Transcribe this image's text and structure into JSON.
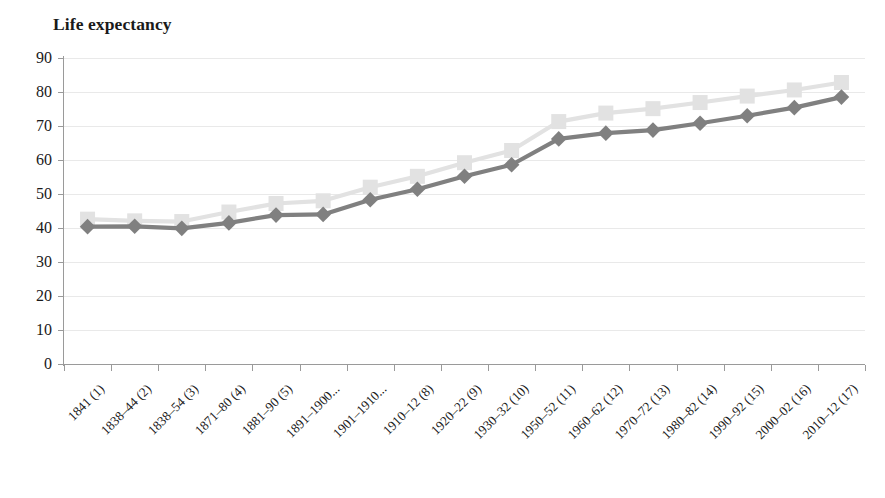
{
  "chart_data": {
    "type": "line",
    "title": "Life expectancy",
    "xlabel": "",
    "ylabel": "",
    "ylim": [
      0,
      90
    ],
    "ytick_step": 10,
    "yticks": [
      90,
      80,
      70,
      60,
      50,
      40,
      30,
      20,
      10,
      0
    ],
    "grid": true,
    "legend_position": "none",
    "categories": [
      "1841 (1)",
      "1838–44 (2)",
      "1838–54 (3)",
      "1871–80 (4)",
      "1881–90 (5)",
      "1891–1900...",
      "1901–1910...",
      "1910–12 (8)",
      "1920–22 (9)",
      "1930–32 (10)",
      "1950–52 (11)",
      "1960–62 (12)",
      "1970–72 (13)",
      "1980–82 (14)",
      "1990–92 (15)",
      "2000–02 (16)",
      "2010–12 (17)"
    ],
    "series": [
      {
        "name": "upper-series",
        "marker": "square",
        "color": "#e2e2e2",
        "values": [
          42.6,
          42.1,
          41.9,
          44.7,
          47.2,
          48.0,
          52.0,
          55.2,
          59.2,
          62.8,
          71.3,
          73.8,
          75.1,
          76.9,
          78.8,
          80.6,
          82.8
        ]
      },
      {
        "name": "lower-series",
        "marker": "diamond",
        "color": "#808080",
        "values": [
          40.4,
          40.5,
          39.9,
          41.5,
          43.8,
          44.0,
          48.3,
          51.4,
          55.2,
          58.6,
          66.2,
          67.9,
          68.8,
          70.8,
          73.0,
          75.4,
          78.5
        ]
      }
    ]
  },
  "colors": {
    "axis": "#9a9a9a",
    "gridline": "#e9e9e9",
    "text": "#1a1a1a",
    "series_light": "#e2e2e2",
    "series_dark": "#808080",
    "background": "#ffffff"
  }
}
